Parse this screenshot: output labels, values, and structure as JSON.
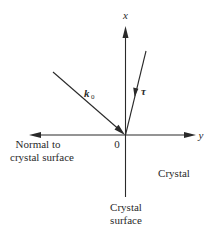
{
  "diagram": {
    "axes": {
      "x_label": "x",
      "y_label": "y",
      "origin_label": "0"
    },
    "vectors": {
      "incident": {
        "symbol": "k",
        "subscript": "0"
      },
      "tau": {
        "symbol": "τ"
      }
    },
    "labels": {
      "normal_line1": "Normal to",
      "normal_line2": "crystal surface",
      "crystal": "Crystal",
      "surface_line1": "Crystal",
      "surface_line2": "surface"
    },
    "colors": {
      "ink": "#2a2a2a",
      "background": "#ffffff"
    }
  }
}
